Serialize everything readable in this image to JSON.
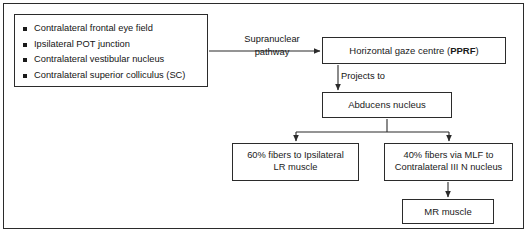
{
  "diagram": {
    "bullet_box": {
      "items": [
        "Contralateral frontal eye field",
        "Ipsilateral POT junction",
        "Contralateral vestibular nucleus",
        "Contralateral superior colliculus (SC)"
      ]
    },
    "labels": {
      "supranuclear_pathway_line1": "Supranuclear",
      "supranuclear_pathway_line2": "pathway",
      "projects_to": "Projects to"
    },
    "nodes": {
      "pprf": {
        "text_plain": "Horizontal gaze centre (",
        "text_bold": "PPRF",
        "text_tail": ")"
      },
      "abducens": "Abducens nucleus",
      "lr_muscle_line1": "60% fibers to Ipsilateral",
      "lr_muscle_line2": "LR muscle",
      "mlf_line1": "40% fibers via MLF to",
      "mlf_line2": "Contralateral III N nucleus",
      "mr_muscle": "MR muscle"
    },
    "colors": {
      "line": "#2b2b2b",
      "text": "#141414",
      "background": "#ffffff"
    }
  }
}
